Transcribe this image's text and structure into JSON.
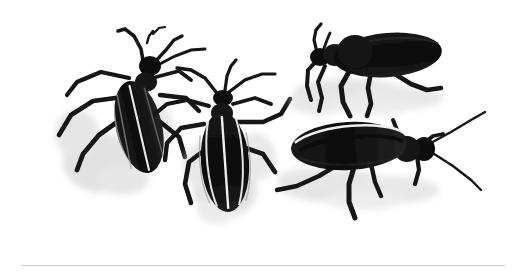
{
  "figure": {
    "kind": "natural-image",
    "medium": "grayscale ink-and-wash illustration",
    "subject": "blister beetles",
    "background_color": "#ffffff",
    "ink_color": "#111111",
    "shadow_color": "#c9c9c9",
    "highlight_color": "#f2f2f2",
    "frame": {
      "present": true,
      "color": "#b4b4b4",
      "thickness_px": 1,
      "left_px": 19,
      "right_px": 505,
      "bottom_px": 264,
      "top_cropped": true
    },
    "caption": "",
    "title": "",
    "specimen_count": 4,
    "specimens": [
      {
        "id": "beetle-upper-left",
        "label": "Beetle 1",
        "view": "dorsal",
        "orientation": "head up-right, body tilted about 20 degrees from vertical",
        "position": "upper left",
        "features": "long segmented antennae, striped elytra, six sprawling legs, soft gray cast shadow to the lower left"
      },
      {
        "id": "beetle-center",
        "label": "Beetle 2",
        "view": "dorsal",
        "orientation": "head up, body nearly vertical",
        "position": "center",
        "features": "oval elytra with three pale longitudinal stripes, spread antennae, gray shadow beneath abdomen"
      },
      {
        "id": "beetle-upper-right",
        "label": "Beetle 3",
        "view": "lateral",
        "orientation": "facing left",
        "position": "upper right",
        "features": "elongated solid-black elytra, short antennae raised, three visible legs, gray shadow along the ground line"
      },
      {
        "id": "beetle-lower-right",
        "label": "Beetle 4",
        "view": "lateral",
        "orientation": "facing right",
        "position": "lower right",
        "features": "elliptical elytra outlined by a bright pale stripe, two very long thin antennae, long bent legs, gray cast shadow"
      }
    ]
  }
}
